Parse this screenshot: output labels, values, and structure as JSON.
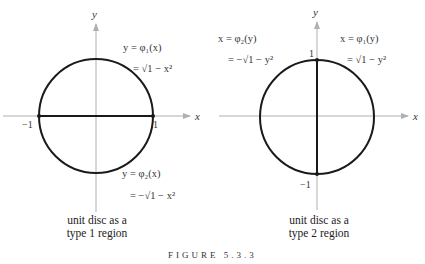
{
  "figure": {
    "caption": "FIGURE 5.3.3",
    "left_panel": {
      "axis_x_label": "x",
      "axis_y_label": "y",
      "tick_left": "−1",
      "tick_right": "1",
      "top_eq_line1": "y = φ₁(x)",
      "top_eq_line2": "= √1 − x²",
      "bottom_eq_line1": "y = φ₂(x)",
      "bottom_eq_line2": "= −√1 − x²",
      "caption_line1": "unit disc as a",
      "caption_line2": "type 1 region"
    },
    "right_panel": {
      "axis_x_label": "x",
      "axis_y_label": "y",
      "tick_top": "1",
      "tick_bottom": "−1",
      "left_eq_line1": "x = φ₂(y)",
      "left_eq_line2": "= −√1 − y²",
      "right_eq_line1": "x = φ₁(y)",
      "right_eq_line2": "= √1 − y²",
      "caption_line1": "unit disc as a",
      "caption_line2": "type 2 region"
    }
  },
  "colors": {
    "axis": "#b0b0b0",
    "curve": "#1a1a1a",
    "text": "#333333"
  }
}
